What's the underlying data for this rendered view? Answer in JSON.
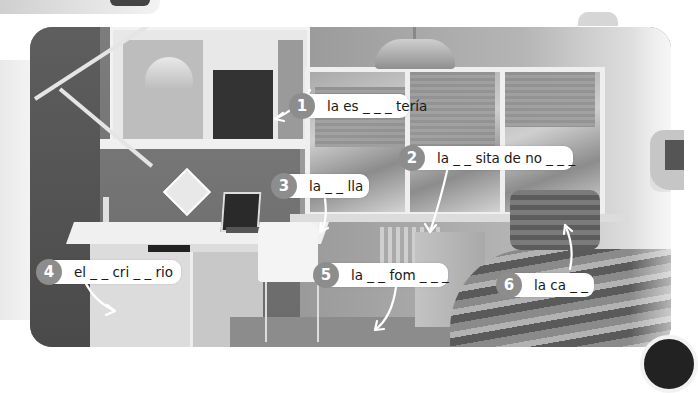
{
  "image": {
    "description": "Textbook illustration: photo of a bedroom with numbered fill-in-the-blank vocabulary labels (Spanish)",
    "number_color": "#8d8d8d",
    "label_bg": "#ffffff"
  },
  "labels": [
    {
      "number": "1",
      "text": "la es _ _ _ tería",
      "pointer": "shelf"
    },
    {
      "number": "2",
      "text": "la _ _ sita de no _ _ _",
      "pointer": "nightstand"
    },
    {
      "number": "3",
      "text": "la _ _ lla",
      "pointer": "chair"
    },
    {
      "number": "4",
      "text": "el _ _ cri _ _ rio",
      "pointer": "desk"
    },
    {
      "number": "5",
      "text": "la _ _ fom _ _ _",
      "pointer": "rug/floor"
    },
    {
      "number": "6",
      "text": "la ca _ _",
      "pointer": "bed"
    }
  ]
}
